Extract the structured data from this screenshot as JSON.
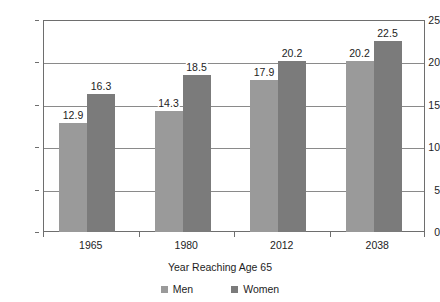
{
  "chart_data": {
    "type": "bar",
    "title": "",
    "subtitle": "",
    "xlabel": "Year Reaching Age 65",
    "ylabel": "",
    "categories": [
      "1965",
      "1980",
      "2012",
      "2038"
    ],
    "series": [
      {
        "name": "Men",
        "values": [
          12.9,
          14.3,
          17.9,
          20.2
        ],
        "color": "#9a9a9a"
      },
      {
        "name": "Women",
        "values": [
          16.3,
          18.5,
          20.2,
          22.5
        ],
        "color": "#7b7b7b"
      }
    ],
    "ylim": [
      0,
      25
    ],
    "yticks": [
      0,
      5,
      10,
      15,
      20,
      25
    ],
    "ytick_labels": [
      "0",
      "5",
      "10",
      "15",
      "20",
      "25"
    ],
    "grid": true,
    "grid_axis": "y",
    "legend_position": "bottom",
    "data_labels": true,
    "data_label_format": "one-decimal",
    "axis_color": "#6e6e6e",
    "grid_color": "#8a8a8a",
    "background": "#ffffff",
    "annotations": []
  },
  "legend": {
    "items": [
      {
        "label": "Men",
        "color": "#9a9a9a"
      },
      {
        "label": "Women",
        "color": "#7b7b7b"
      }
    ]
  }
}
